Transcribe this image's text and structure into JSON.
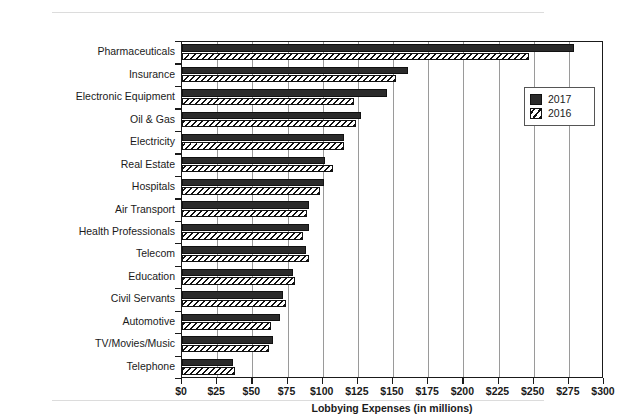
{
  "chart_data": {
    "type": "bar",
    "orientation": "horizontal",
    "title": "",
    "xlabel": "Lobbying Expenses (in millions)",
    "ylabel": "",
    "xlim": [
      0,
      300
    ],
    "xticks": [
      "$0",
      "$25",
      "$50",
      "$75",
      "$100",
      "$125",
      "$150",
      "$175",
      "$200",
      "$225",
      "$250",
      "$275",
      "$300"
    ],
    "xtick_values": [
      0,
      25,
      50,
      75,
      100,
      125,
      150,
      175,
      200,
      225,
      250,
      275,
      300
    ],
    "grid": "vertical",
    "legend_position": "top-right",
    "categories": [
      "Pharmaceuticals",
      "Insurance",
      "Electronic Equipment",
      "Oil & Gas",
      "Electricity",
      "Real Estate",
      "Hospitals",
      "Air Transport",
      "Health Professionals",
      "Telecom",
      "Education",
      "Civil Servants",
      "Automotive",
      "TV/Movies/Music",
      "Telephone"
    ],
    "series": [
      {
        "name": "2017",
        "color": "#2b2b2b",
        "pattern": "solid",
        "values": [
          279,
          161,
          146,
          127,
          115,
          102,
          101,
          90,
          90,
          88,
          79,
          72,
          70,
          65,
          36
        ]
      },
      {
        "name": "2016",
        "color": "#ffffff",
        "pattern": "diagonal-hatch",
        "values": [
          247,
          152,
          122,
          124,
          115,
          107,
          98,
          89,
          86,
          90,
          80,
          74,
          63,
          62,
          38
        ]
      }
    ]
  },
  "legend": {
    "entries": [
      {
        "label": "2017",
        "swatch": "solid-black-swatch"
      },
      {
        "label": "2016",
        "swatch": "hatched-swatch"
      }
    ]
  }
}
